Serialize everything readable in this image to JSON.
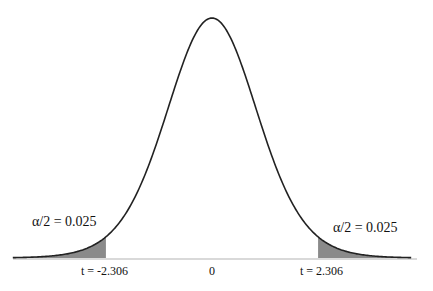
{
  "chart_data": {
    "type": "area",
    "title": "",
    "distribution": "t",
    "center_label": "0",
    "critical_values": [
      -2.306,
      2.306
    ],
    "alpha": 0.05,
    "tail_area": 0.025,
    "annotations": {
      "left_tail": "α/2 = 0.025",
      "right_tail": "α/2 = 0.025",
      "left_critical": "t = -2.306",
      "right_critical": "t = 2.306",
      "center": "0"
    },
    "x_range": [
      -4.33,
      4.33
    ],
    "grid": false,
    "legend": "none",
    "colors": {
      "curve": "#222222",
      "shade": "#8a8a8a",
      "baseline": "#cccccc"
    },
    "render": {
      "center_px": 212,
      "baseline_px": 258,
      "peak_px": 18,
      "px_per_unit": 46,
      "shape_df": 15
    }
  }
}
